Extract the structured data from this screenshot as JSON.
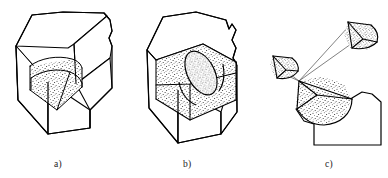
{
  "figure": {
    "background_color": "#ffffff",
    "line_color": "#000000",
    "stipple_color": "#1c1c1c",
    "thin_line_color": "#4a4a4a",
    "width": 388,
    "height": 178
  },
  "panels": [
    {
      "id": "a",
      "caption": "a)",
      "description": "Rectangular block with a chamfered top face; a stippled quarter-cylinder wedge is cut into the front corner, showing a curved fillet surface and two flat radial faces.",
      "shaded_region": "quarter-cylinder corner cut",
      "texture": "stipple"
    },
    {
      "id": "b",
      "caption": "b)",
      "description": "Rectangular block with a chamfered top face; a stippled rectangular pocket is cut into the top, with an inclined elliptical cylinder intersecting it.",
      "shaded_region": "rectangular pocket with elliptical cylinder",
      "texture": "stipple"
    },
    {
      "id": "c",
      "caption": "c)",
      "description": "Exploded assembly view: a stippled fan-shaped sector attached to a notched base, with two smaller stippled wedge fragments displaced away and joined to the apex by thin leader lines.",
      "shaded_region": "fan sector and two displaced wedge fragments",
      "texture": "stipple"
    }
  ]
}
